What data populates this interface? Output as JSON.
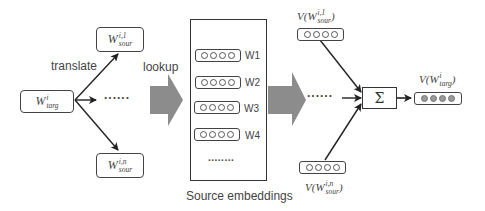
{
  "diagram": {
    "target_word": {
      "base": "W",
      "sup": "i",
      "sub": "targ"
    },
    "source_words": [
      {
        "base": "W",
        "sup": "i,1",
        "sub": "sour"
      },
      {
        "base": "W",
        "sup": "i,n",
        "sub": "sour"
      }
    ],
    "edge_labels": {
      "translate": "translate",
      "lookup": "lookup"
    },
    "ellipsis_short": "......",
    "ellipsis_long": "........",
    "embedding_table": {
      "caption": "Source embeddings",
      "rows": [
        {
          "label": "W1"
        },
        {
          "label": "W2"
        },
        {
          "label": "W3"
        },
        {
          "label": "W4"
        }
      ]
    },
    "source_vectors": [
      {
        "label": "V(W^{i,1}_{sour})",
        "func": "V(",
        "base": "W",
        "sup": "i,1",
        "sub": "sour",
        "close": ")"
      },
      {
        "label": "V(W^{i,n}_{sour})",
        "func": "V(",
        "base": "W",
        "sup": "i,n",
        "sub": "sour",
        "close": ")"
      }
    ],
    "sum_symbol": "Σ",
    "output_vector": {
      "label": "V(W^{i}_{targ})",
      "func": "V(",
      "base": "W",
      "sup": "i",
      "sub": "targ",
      "close": ")"
    },
    "colors": {
      "line": "#222222",
      "block_arrow": "#8c8c8c",
      "filled_circle": "#999999"
    }
  }
}
